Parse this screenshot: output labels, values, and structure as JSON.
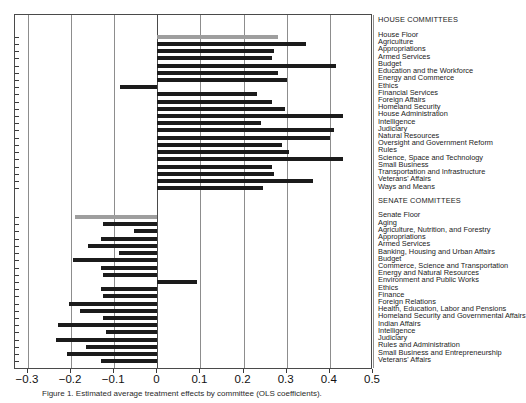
{
  "figure": {
    "caption": "Figure 1. Estimated average treatment effects by committee (OLS coefficients).",
    "colors": {
      "bar": "#1b1b1b",
      "bar_highlight": "#9e9e9e",
      "grid": "#8d8d8d",
      "axis": "#4a4a4a"
    }
  },
  "axis": {
    "ticks": [
      "-0.3",
      "-0.2",
      "-0.1",
      "0",
      "0.1",
      "0.2",
      "0.3",
      "0.4",
      "0.5"
    ],
    "tick_values": [
      -0.3,
      -0.2,
      -0.1,
      0,
      0.1,
      0.2,
      0.3,
      0.4,
      0.5
    ],
    "xlim": [
      -0.33,
      0.5
    ]
  },
  "groups": [
    {
      "id": "house",
      "heading": "HOUSE COMMITTEES"
    },
    {
      "id": "senate",
      "heading": "SENATE COMMITTEES"
    }
  ],
  "chart_data": {
    "type": "bar",
    "orientation": "horizontal",
    "title": "",
    "xlabel": "",
    "ylabel": "",
    "xlim": [
      -0.33,
      0.5
    ],
    "grid": true,
    "legend": "none",
    "group_headings": [
      "HOUSE COMMITTEES",
      "SENATE COMMITTEES"
    ],
    "categories": [
      "House Floor",
      "Agriculture",
      "Appropriations",
      "Armed Services",
      "Budget",
      "Education and the Workforce",
      "Energy and Commerce",
      "Ethics",
      "Financial Services",
      "Foreign Affairs",
      "Homeland Security",
      "House Administration",
      "Intelligence",
      "Judiciary",
      "Natural Resources",
      "Oversight and Government Reform",
      "Rules",
      "Science, Space and Technology",
      "Small Business",
      "Transportation and Infrastructure",
      "Veterans' Affairs",
      "Ways and Means",
      "Senate Floor",
      "Aging",
      "Agriculture, Nutrition, and Forestry",
      "Appropriations",
      "Armed Services",
      "Banking, Housing and Urban Affairs",
      "Budget",
      "Commerce, Science and Transportation",
      "Energy and Natural Resources",
      "Environment and Public Works",
      "Ethics",
      "Finance",
      "Foreign Relations",
      "Health, Education, Labor and Pensions",
      "Homeland Security and Governmental Affairs",
      "Indian Affairs",
      "Intelligence",
      "Judiciary",
      "Rules and Administration",
      "Small Business and Entrepreneurship",
      "Veterans' Affairs"
    ],
    "values": [
      0.28,
      0.345,
      0.27,
      0.265,
      0.415,
      0.28,
      0.3,
      -0.086,
      0.23,
      0.265,
      0.295,
      0.43,
      0.24,
      0.41,
      0.4,
      0.29,
      0.305,
      0.43,
      0.265,
      0.27,
      0.36,
      0.245,
      -0.19,
      -0.125,
      -0.055,
      -0.13,
      -0.16,
      -0.09,
      -0.195,
      -0.13,
      -0.125,
      0.093,
      -0.13,
      -0.125,
      -0.205,
      -0.18,
      -0.125,
      -0.23,
      -0.12,
      -0.235,
      -0.165,
      -0.21,
      -0.13
    ],
    "highlight_categories": [
      "House Floor",
      "Senate Floor"
    ],
    "group_of": [
      "house",
      "house",
      "house",
      "house",
      "house",
      "house",
      "house",
      "house",
      "house",
      "house",
      "house",
      "house",
      "house",
      "house",
      "house",
      "house",
      "house",
      "house",
      "house",
      "house",
      "house",
      "house",
      "senate",
      "senate",
      "senate",
      "senate",
      "senate",
      "senate",
      "senate",
      "senate",
      "senate",
      "senate",
      "senate",
      "senate",
      "senate",
      "senate",
      "senate",
      "senate",
      "senate",
      "senate",
      "senate",
      "senate",
      "senate"
    ]
  }
}
